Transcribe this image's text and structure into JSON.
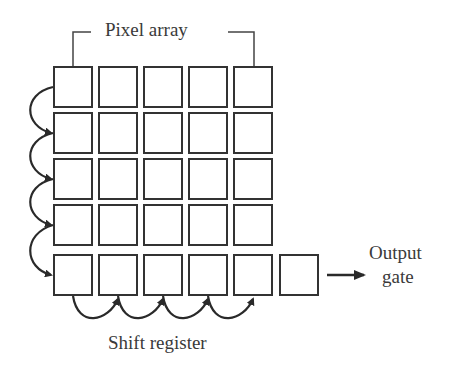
{
  "diagram": {
    "title_label": "Pixel array",
    "shift_register_label": "Shift register",
    "output_label_line1": "Output",
    "output_label_line2": "gate",
    "grid": {
      "rows": 5,
      "cols": 5,
      "extra_output_cell": true
    },
    "stroke_color": "#333333"
  }
}
